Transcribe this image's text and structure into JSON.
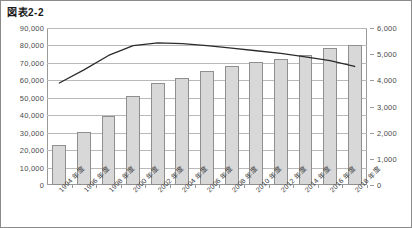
{
  "title": "図表2-2",
  "chart_data": {
    "type": "bar",
    "title": "図表2-2",
    "xlabel": "",
    "ylabel": "",
    "grid": true,
    "legend": "none",
    "categories": [
      "1994 年度",
      "1996 年度",
      "1998 年度",
      "2000 年度",
      "2002 年度",
      "2004 年度",
      "2006 年度",
      "2008 年度",
      "2010 年度",
      "2012 年度",
      "2014 年度",
      "2016 年度",
      "2018 年度"
    ],
    "axes": {
      "left": {
        "min": 0,
        "max": 90000,
        "step": 10000,
        "ticks": [
          "0",
          "10,000",
          "20,000",
          "30,000",
          "40,000",
          "50,000",
          "60,000",
          "70,000",
          "80,000",
          "90,000"
        ]
      },
      "right": {
        "min": 0,
        "max": 6000,
        "step": 1000,
        "ticks": [
          "0",
          "1,000",
          "2,000",
          "3,000",
          "4,000",
          "5,000",
          "6,000"
        ]
      }
    },
    "series": [
      {
        "name": "bars",
        "type": "bar",
        "axis": "left",
        "values": [
          23000,
          30500,
          39800,
          51000,
          58500,
          61500,
          65500,
          68500,
          70500,
          72500,
          74500,
          78500,
          80500
        ]
      },
      {
        "name": "line",
        "type": "line",
        "axis": "right",
        "values": [
          3900,
          4400,
          4950,
          5330,
          5430,
          5400,
          5330,
          5230,
          5130,
          5030,
          4900,
          4750,
          4530
        ]
      }
    ]
  },
  "colors": {
    "bar_fill": "#d8d8d8",
    "bar_border": "#8f8f8f",
    "line": "#2b2b2b",
    "grid": "#b9b9b9",
    "axis": "#9a9a9a",
    "text": "#3a3a3a",
    "frame": "#8a8a8a"
  }
}
